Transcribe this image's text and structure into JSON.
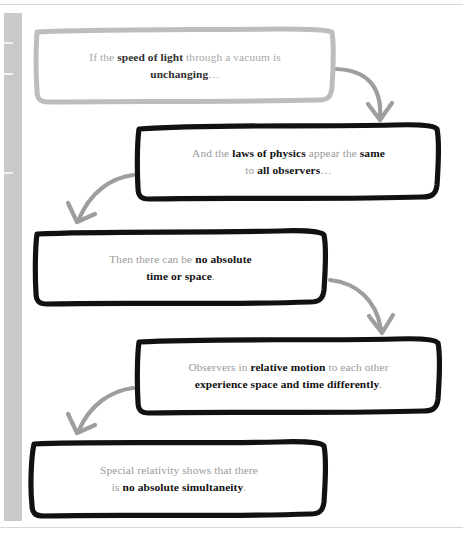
{
  "page": {
    "background": "#ffffff",
    "rule_color": "#d8d8d8",
    "gutter_color": "#c9c9c9",
    "gutter_tick_color": "#f2f2f2",
    "gutter_ticks_y": [
      42,
      73,
      172
    ]
  },
  "diagram": {
    "type": "flowchart",
    "style": "hand-drawn boxes with curved arrows",
    "colors": {
      "first_box_border": "#bdbdbd",
      "box_border": "#111111",
      "arrow": "#9e9e9e",
      "body_text": "#9a9a9a",
      "emphasis_text": "#111111"
    },
    "nodes": [
      {
        "id": "node-1",
        "order": 1,
        "border": "gray",
        "lines": [
          {
            "segments": [
              {
                "text": "If the ",
                "bold": false
              },
              {
                "text": "speed of light",
                "bold": true
              },
              {
                "text": " through a vacuum is",
                "bold": false
              }
            ]
          },
          {
            "segments": [
              {
                "text": "unchanging",
                "bold": true
              },
              {
                "text": "…",
                "bold": false
              }
            ]
          }
        ],
        "plain_text": "If the speed of light through a vacuum is unchanging…",
        "x": 36,
        "y": 30,
        "w": 298,
        "h": 72
      },
      {
        "id": "node-2",
        "order": 2,
        "border": "black",
        "lines": [
          {
            "segments": [
              {
                "text": "And the ",
                "bold": false
              },
              {
                "text": "laws of physics",
                "bold": true
              },
              {
                "text": " appear the ",
                "bold": false
              },
              {
                "text": "same",
                "bold": true
              }
            ]
          },
          {
            "segments": [
              {
                "text": "to ",
                "bold": false
              },
              {
                "text": "all observers",
                "bold": true
              },
              {
                "text": "…",
                "bold": false
              }
            ]
          }
        ],
        "plain_text": "And the laws of physics appear the same to all observers…",
        "x": 137,
        "y": 126,
        "w": 303,
        "h": 72
      },
      {
        "id": "node-3",
        "order": 3,
        "border": "black",
        "lines": [
          {
            "segments": [
              {
                "text": "Then there can be ",
                "bold": false
              },
              {
                "text": "no absolute",
                "bold": true
              }
            ]
          },
          {
            "segments": [
              {
                "text": "time or space",
                "bold": true
              },
              {
                "text": ".",
                "bold": false
              }
            ]
          }
        ],
        "plain_text": "Then there can be no absolute time or space.",
        "x": 36,
        "y": 232,
        "w": 289,
        "h": 72
      },
      {
        "id": "node-4",
        "order": 4,
        "border": "black",
        "lines": [
          {
            "segments": [
              {
                "text": "Observers in ",
                "bold": false
              },
              {
                "text": "relative motion",
                "bold": true
              },
              {
                "text": " to each other",
                "bold": false
              }
            ]
          },
          {
            "segments": [
              {
                "text": "experience space and time differently",
                "bold": true
              },
              {
                "text": ".",
                "bold": false
              }
            ]
          }
        ],
        "plain_text": "Observers in relative motion to each other experience space and time differently.",
        "x": 137,
        "y": 340,
        "w": 303,
        "h": 72
      },
      {
        "id": "node-5",
        "order": 5,
        "border": "black",
        "lines": [
          {
            "segments": [
              {
                "text": "Special relativity shows that there",
                "bold": false
              }
            ]
          },
          {
            "segments": [
              {
                "text": "is ",
                "bold": false
              },
              {
                "text": "no absolute simultaneity",
                "bold": true
              },
              {
                "text": ".",
                "bold": false
              }
            ]
          }
        ],
        "plain_text": "Special relativity shows that there is no absolute simultaneity.",
        "x": 31,
        "y": 443,
        "w": 296,
        "h": 72
      }
    ],
    "arrows": [
      {
        "id": "arrow-1",
        "from": "node-1",
        "to": "node-2",
        "direction": "right-down"
      },
      {
        "id": "arrow-2",
        "from": "node-2",
        "to": "node-3",
        "direction": "left-down"
      },
      {
        "id": "arrow-3",
        "from": "node-3",
        "to": "node-4",
        "direction": "right-down"
      },
      {
        "id": "arrow-4",
        "from": "node-4",
        "to": "node-5",
        "direction": "left-down"
      }
    ]
  }
}
